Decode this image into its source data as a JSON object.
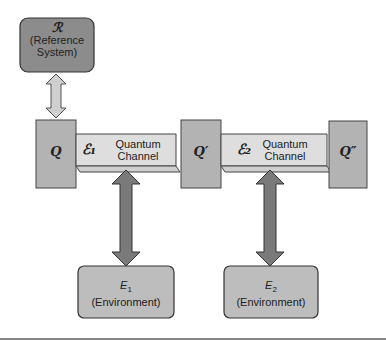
{
  "diagram": {
    "reference": {
      "symbol": "ℛ",
      "label_line1": "(Reference",
      "label_line2": "System)"
    },
    "nodes": [
      {
        "id": "Q",
        "label": "Q"
      },
      {
        "id": "Q1",
        "label": "Q′"
      },
      {
        "id": "Q2",
        "label": "Q″"
      }
    ],
    "channels": [
      {
        "symbol": "ℰ₁",
        "line1": "Quantum",
        "line2": "Channel"
      },
      {
        "symbol": "ℰ₂",
        "line1": "Quantum",
        "line2": "Channel"
      }
    ],
    "environments": [
      {
        "symbol": "E",
        "sub": "1",
        "label": "(Environment)"
      },
      {
        "symbol": "E",
        "sub": "2",
        "label": "(Environment)"
      }
    ],
    "colors": {
      "reference_box": "#8a8a8a",
      "node_box": "#b3b3b3",
      "channel": "#dcdcdc",
      "env_box": "#bdbdbd",
      "arrow_dark": "#7a7a7a",
      "arrow_light": "#c8c8c8"
    }
  }
}
